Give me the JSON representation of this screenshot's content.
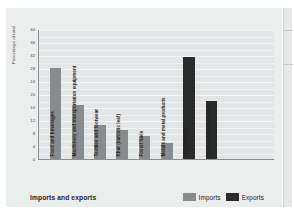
{
  "chart_data": {
    "type": "bar",
    "title": "",
    "xlabel": "Imports and exports",
    "ylabel": "Percentage of total",
    "ylim": [
      0,
      40
    ],
    "ytick_step": 4,
    "yticks": [
      "0",
      "4",
      "8",
      "12",
      "16",
      "20",
      "24",
      "28",
      "32",
      "36",
      "40"
    ],
    "grid": true,
    "legend_position": "bottom-right",
    "categories": [
      "Food and beverages",
      "Machinery and transportation equipment",
      "Textiles and footwear",
      "Khat (narcotic leaf)",
      "Fossil fuels",
      "Metals and metal products",
      "Live animals",
      "Food and food products"
    ],
    "series": [
      {
        "name": "Imports",
        "color": "#8a8b8c",
        "values": [
          28,
          16.5,
          10.5,
          9,
          7,
          5,
          null,
          null
        ]
      },
      {
        "name": "Exports",
        "color": "#2b2b2b",
        "values": [
          null,
          null,
          null,
          null,
          null,
          null,
          31.5,
          18
        ]
      }
    ]
  },
  "legend": {
    "items": [
      {
        "label": "Imports",
        "color": "#8a8b8c"
      },
      {
        "label": "Exports",
        "color": "#2b2b2b"
      }
    ]
  },
  "axis": {
    "x_title": "Imports and exports",
    "y_title": "Percentage of total"
  }
}
